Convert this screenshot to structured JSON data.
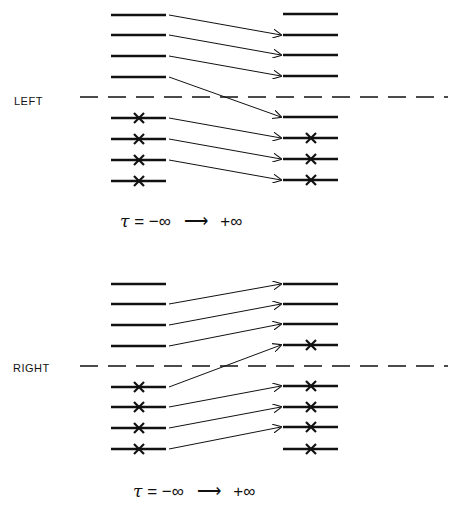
{
  "panels": [
    {
      "label": "LEFT",
      "caption": {
        "tau": "τ",
        "equals": "=",
        "from": "−∞",
        "arrow": "⟶",
        "to": "+∞"
      },
      "left_levels": [
        {
          "y": 15,
          "crossed": false
        },
        {
          "y": 35,
          "crossed": false
        },
        {
          "y": 56,
          "crossed": false
        },
        {
          "y": 77,
          "crossed": false
        },
        {
          "y": 118,
          "crossed": true
        },
        {
          "y": 139,
          "crossed": true
        },
        {
          "y": 160,
          "crossed": true
        },
        {
          "y": 181,
          "crossed": true
        }
      ],
      "right_levels": [
        {
          "y": 14,
          "crossed": false
        },
        {
          "y": 35,
          "crossed": false
        },
        {
          "y": 55,
          "crossed": false
        },
        {
          "y": 76,
          "crossed": false
        },
        {
          "y": 117,
          "crossed": false
        },
        {
          "y": 138,
          "crossed": true
        },
        {
          "y": 159,
          "crossed": true
        },
        {
          "y": 180,
          "crossed": true
        }
      ],
      "arrows": [
        [
          0,
          1
        ],
        [
          1,
          2
        ],
        [
          2,
          3
        ],
        [
          3,
          4
        ],
        [
          4,
          5
        ],
        [
          5,
          6
        ],
        [
          6,
          7
        ]
      ],
      "divider_y": 97
    },
    {
      "label": "RIGHT",
      "caption": {
        "tau": "τ",
        "equals": "=",
        "from": "−∞",
        "arrow": "⟶",
        "to": "+∞"
      },
      "left_levels": [
        {
          "y": 284,
          "crossed": false
        },
        {
          "y": 304,
          "crossed": false
        },
        {
          "y": 325,
          "crossed": false
        },
        {
          "y": 346,
          "crossed": false
        },
        {
          "y": 387,
          "crossed": true
        },
        {
          "y": 407,
          "crossed": true
        },
        {
          "y": 428,
          "crossed": true
        },
        {
          "y": 449,
          "crossed": true
        }
      ],
      "right_levels": [
        {
          "y": 284,
          "crossed": false
        },
        {
          "y": 304,
          "crossed": false
        },
        {
          "y": 324,
          "crossed": false
        },
        {
          "y": 345,
          "crossed": true
        },
        {
          "y": 386,
          "crossed": true
        },
        {
          "y": 407,
          "crossed": true
        },
        {
          "y": 427,
          "crossed": true
        },
        {
          "y": 449,
          "crossed": true
        }
      ],
      "arrows": [
        [
          1,
          0
        ],
        [
          2,
          1
        ],
        [
          3,
          2
        ],
        [
          4,
          3
        ],
        [
          5,
          4
        ],
        [
          6,
          5
        ],
        [
          7,
          6
        ]
      ],
      "divider_y": 366
    }
  ],
  "geometry": {
    "left_x": [
      111,
      166
    ],
    "right_x": [
      283,
      338
    ],
    "left_cross_x": 139,
    "right_cross_x": 311,
    "divider_x": [
      80,
      448
    ]
  }
}
